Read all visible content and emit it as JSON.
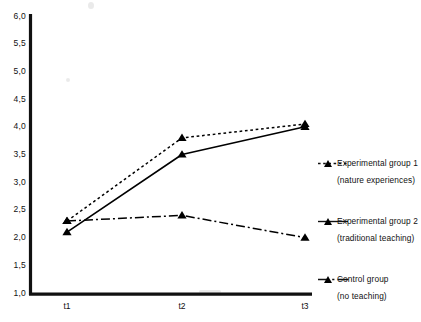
{
  "chart_data": {
    "type": "line",
    "title": "",
    "xlabel": "",
    "ylabel": "",
    "categories": [
      "t1",
      "t2",
      "t3"
    ],
    "ylim": [
      1.0,
      6.0
    ],
    "yticks": [
      "1,0",
      "1,5",
      "2,0",
      "2,5",
      "3,0",
      "3,5",
      "4,0",
      "4,5",
      "5,0",
      "5,5",
      "6,0"
    ],
    "ytick_values": [
      1.0,
      1.5,
      2.0,
      2.5,
      3.0,
      3.5,
      4.0,
      4.5,
      5.0,
      5.5,
      6.0
    ],
    "grid": false,
    "legend_position": "right",
    "decimal_separator": ",",
    "series": [
      {
        "name": "Experimental group 1",
        "sub": "(nature experiences)",
        "linestyle": "dotted",
        "marker": "triangle",
        "color": "#000000",
        "values": [
          2.3,
          3.8,
          4.05
        ]
      },
      {
        "name": "Experimental group 2",
        "sub": "(traditional teaching)",
        "linestyle": "solid",
        "marker": "triangle",
        "color": "#000000",
        "values": [
          2.1,
          3.5,
          4.0
        ]
      },
      {
        "name": "Control group",
        "sub": "(no teaching)",
        "linestyle": "dashdot",
        "marker": "triangle",
        "color": "#000000",
        "values": [
          2.3,
          2.4,
          2.0
        ]
      }
    ]
  },
  "axes": {
    "x_tick_labels": [
      "t1",
      "t2",
      "t3"
    ],
    "y_tick_labels": [
      "6,0",
      "5,5",
      "5,0",
      "4,5",
      "4,0",
      "3,5",
      "3,0",
      "2,5",
      "2,0",
      "1,5",
      "1,0"
    ]
  },
  "legend": {
    "entries": [
      {
        "label": "Experimental group 1",
        "sub": "(nature experiences)",
        "style": "dotted"
      },
      {
        "label": "Experimental group 2",
        "sub": "(traditional teaching)",
        "style": "solid"
      },
      {
        "label": "Control group",
        "sub": "(no teaching)",
        "style": "dashdot"
      }
    ]
  }
}
